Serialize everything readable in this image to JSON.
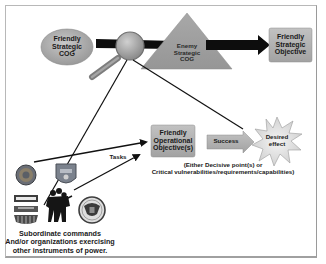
{
  "diagram": {
    "nodes": {
      "friendly_cog": {
        "lines": [
          "Friendly",
          "Strategic",
          "COG"
        ]
      },
      "enemy_cog": {
        "lines": [
          "Enemy",
          "Strategic",
          "COG"
        ]
      },
      "friendly_objective": {
        "lines": [
          "Friendly",
          "Strategic",
          "Objective"
        ]
      },
      "operational_objective": {
        "lines": [
          "Friendly",
          "Operational",
          "Objective(s)"
        ]
      },
      "success": {
        "label": "Success"
      },
      "desired_effect": {
        "lines": [
          "Desired",
          "effect"
        ]
      }
    },
    "annotations": {
      "tasks": "Tasks",
      "decisive_points_line1": "(Either Decisive point(s) or",
      "decisive_points_line2": "Critical vulnerabilities/requirements/capabilities)"
    },
    "caption": {
      "line1": "Subordinate commands",
      "line2": "And/or organizations exercising",
      "line3": "other instruments of power."
    },
    "icons": [
      "army-seal-icon",
      "air-force-emblem-icon",
      "usaid-logo-icon",
      "soldiers-silhouette-icon",
      "state-department-seal-icon"
    ],
    "colors": {
      "node_fill": "#a9a9a9",
      "node_fill_light": "#c4c4c4",
      "arrow": "#111111",
      "frame": "#b8b8b8",
      "star_fill": "#e4e4e4"
    }
  }
}
